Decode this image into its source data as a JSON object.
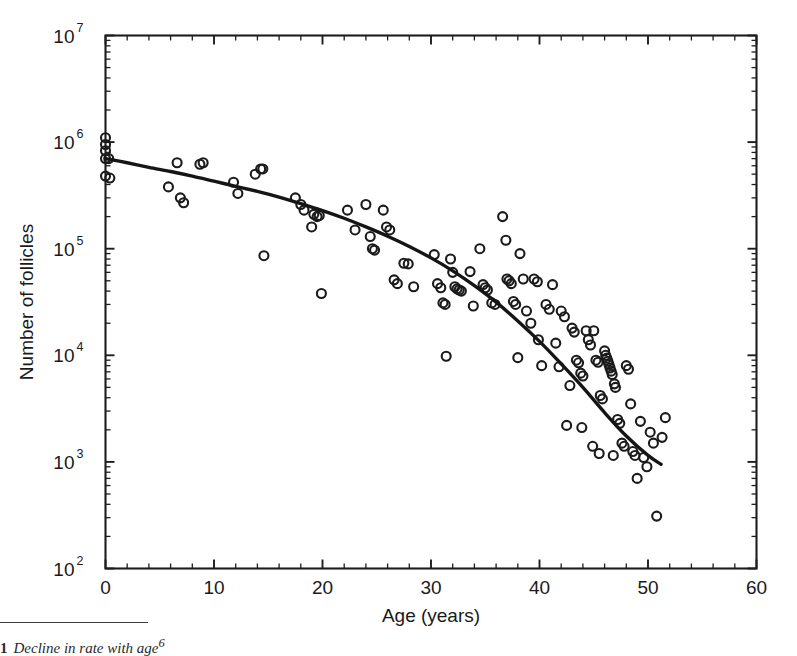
{
  "figure": {
    "caption_number": "1",
    "caption_text": "Decline in rate with age",
    "caption_superscript": "6"
  },
  "chart_data": {
    "type": "scatter",
    "title": "",
    "xlabel": "Age (years)",
    "ylabel": "Number of follicles",
    "xlim": [
      0,
      60
    ],
    "ylim": [
      100,
      10000000
    ],
    "yscale": "log",
    "xscale": "linear",
    "grid": false,
    "legend": null,
    "xticks": [
      0,
      10,
      20,
      30,
      40,
      50,
      60
    ],
    "xtick_labels": [
      "0",
      "10",
      "20",
      "30",
      "40",
      "50",
      "60"
    ],
    "yticks": [
      100,
      1000,
      10000,
      100000,
      1000000,
      10000000
    ],
    "ytick_labels": [
      "10",
      "10",
      "10",
      "10",
      "10",
      "10"
    ],
    "ytick_exponents": [
      "2",
      "3",
      "4",
      "5",
      "6",
      "7"
    ],
    "minor_ticks": true,
    "tick_direction": "in",
    "marker": "open-circle",
    "marker_size": 9,
    "series": [
      {
        "name": "follicle counts",
        "points": [
          [
            0.0,
            1100000
          ],
          [
            0.0,
            950000
          ],
          [
            0.0,
            830000
          ],
          [
            0.0,
            700000
          ],
          [
            0.0,
            480000
          ],
          [
            0.3,
            700000
          ],
          [
            0.4,
            460000
          ],
          [
            5.8,
            380000
          ],
          [
            6.6,
            640000
          ],
          [
            6.9,
            300000
          ],
          [
            7.2,
            270000
          ],
          [
            8.7,
            620000
          ],
          [
            9.0,
            640000
          ],
          [
            11.8,
            420000
          ],
          [
            12.2,
            330000
          ],
          [
            13.8,
            500000
          ],
          [
            14.3,
            560000
          ],
          [
            14.5,
            560000
          ],
          [
            14.6,
            86000
          ],
          [
            17.5,
            300000
          ],
          [
            18.0,
            260000
          ],
          [
            18.3,
            230000
          ],
          [
            19.0,
            160000
          ],
          [
            19.2,
            210000
          ],
          [
            19.5,
            200000
          ],
          [
            19.7,
            205000
          ],
          [
            19.9,
            38000
          ],
          [
            22.3,
            230000
          ],
          [
            23.0,
            150000
          ],
          [
            24.0,
            260000
          ],
          [
            24.4,
            130000
          ],
          [
            24.6,
            100000
          ],
          [
            24.8,
            97000
          ],
          [
            25.6,
            230000
          ],
          [
            25.9,
            160000
          ],
          [
            26.2,
            150000
          ],
          [
            26.6,
            51000
          ],
          [
            26.9,
            47000
          ],
          [
            27.5,
            73000
          ],
          [
            27.9,
            72000
          ],
          [
            28.4,
            44000
          ],
          [
            30.3,
            88000
          ],
          [
            30.6,
            47000
          ],
          [
            30.9,
            43000
          ],
          [
            31.1,
            31000
          ],
          [
            31.3,
            30000
          ],
          [
            31.4,
            9800
          ],
          [
            31.8,
            80000
          ],
          [
            32.0,
            60000
          ],
          [
            32.2,
            44000
          ],
          [
            32.4,
            42000
          ],
          [
            32.6,
            41000
          ],
          [
            32.8,
            40000
          ],
          [
            33.6,
            61000
          ],
          [
            33.9,
            29000
          ],
          [
            34.5,
            100000
          ],
          [
            34.8,
            46000
          ],
          [
            35.0,
            43000
          ],
          [
            35.2,
            41000
          ],
          [
            35.6,
            31000
          ],
          [
            35.9,
            30000
          ],
          [
            36.6,
            200000
          ],
          [
            36.9,
            120000
          ],
          [
            37.0,
            52000
          ],
          [
            37.2,
            50000
          ],
          [
            37.4,
            47000
          ],
          [
            37.6,
            32000
          ],
          [
            37.8,
            30000
          ],
          [
            38.2,
            90000
          ],
          [
            38.5,
            52000
          ],
          [
            38.8,
            26000
          ],
          [
            39.5,
            52000
          ],
          [
            39.8,
            49000
          ],
          [
            39.9,
            14000
          ],
          [
            40.6,
            30000
          ],
          [
            40.9,
            27000
          ],
          [
            41.2,
            46000
          ],
          [
            41.5,
            13000
          ],
          [
            42.0,
            26000
          ],
          [
            42.3,
            23000
          ],
          [
            42.5,
            2200
          ],
          [
            43.0,
            18000
          ],
          [
            43.2,
            16500
          ],
          [
            43.4,
            9000
          ],
          [
            43.6,
            8500
          ],
          [
            43.8,
            6800
          ],
          [
            44.0,
            6400
          ],
          [
            44.3,
            17000
          ],
          [
            44.5,
            14000
          ],
          [
            44.7,
            12500
          ],
          [
            45.0,
            17000
          ],
          [
            45.2,
            9000
          ],
          [
            45.4,
            8600
          ],
          [
            45.6,
            4200
          ],
          [
            45.8,
            3900
          ],
          [
            46.0,
            11000
          ],
          [
            46.1,
            10000
          ],
          [
            46.2,
            9400
          ],
          [
            46.3,
            8800
          ],
          [
            46.4,
            8200
          ],
          [
            46.5,
            7600
          ],
          [
            46.6,
            7100
          ],
          [
            46.7,
            6600
          ],
          [
            46.9,
            5400
          ],
          [
            47.0,
            5000
          ],
          [
            47.2,
            2500
          ],
          [
            47.4,
            2300
          ],
          [
            47.6,
            1500
          ],
          [
            47.8,
            1400
          ],
          [
            48.0,
            8000
          ],
          [
            48.2,
            7400
          ],
          [
            48.4,
            3500
          ],
          [
            48.6,
            1250
          ],
          [
            48.8,
            1150
          ],
          [
            49.0,
            700
          ],
          [
            49.3,
            2400
          ],
          [
            49.6,
            1100
          ],
          [
            49.9,
            900
          ],
          [
            50.2,
            1900
          ],
          [
            50.5,
            1500
          ],
          [
            50.8,
            310
          ],
          [
            51.3,
            1700
          ],
          [
            51.6,
            2600
          ],
          [
            44.9,
            1400
          ],
          [
            45.5,
            1200
          ],
          [
            46.8,
            1150
          ],
          [
            43.9,
            2100
          ],
          [
            42.8,
            5200
          ],
          [
            41.8,
            7800
          ],
          [
            40.2,
            8000
          ],
          [
            39.2,
            20000
          ],
          [
            38.0,
            9500
          ]
        ]
      }
    ],
    "fit_curve": {
      "name": "fitted decline",
      "points": [
        [
          0.0,
          700000
        ],
        [
          2.0,
          640000
        ],
        [
          4.0,
          580000
        ],
        [
          6.0,
          530000
        ],
        [
          8.0,
          480000
        ],
        [
          10.0,
          430000
        ],
        [
          12.0,
          385000
        ],
        [
          14.0,
          345000
        ],
        [
          16.0,
          305000
        ],
        [
          18.0,
          265000
        ],
        [
          20.0,
          228000
        ],
        [
          22.0,
          193000
        ],
        [
          24.0,
          160000
        ],
        [
          26.0,
          131000
        ],
        [
          28.0,
          105000
        ],
        [
          30.0,
          82000
        ],
        [
          32.0,
          62000
        ],
        [
          34.0,
          45000
        ],
        [
          36.0,
          31500
        ],
        [
          38.0,
          21000
        ],
        [
          40.0,
          13500
        ],
        [
          42.0,
          8300
        ],
        [
          44.0,
          5000
        ],
        [
          46.0,
          2900
        ],
        [
          48.0,
          1750
        ],
        [
          50.0,
          1150
        ],
        [
          51.2,
          950
        ]
      ]
    }
  }
}
